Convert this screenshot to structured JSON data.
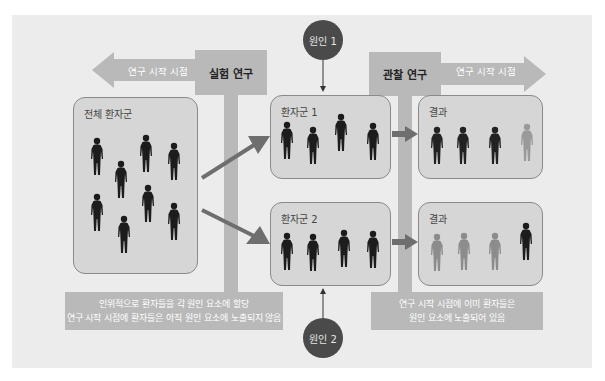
{
  "diagram": {
    "experimental": {
      "label": "실험 연구",
      "arrow_text": "연구 시작 시점",
      "arrow_direction": "left"
    },
    "observational": {
      "label": "관찰 연구",
      "arrow_text": "연구 시작 시점",
      "arrow_direction": "right"
    },
    "causes": [
      {
        "label": "원인 1"
      },
      {
        "label": "원인 2"
      }
    ],
    "whole_population": {
      "title": "전체 환자군",
      "figure_count": 8
    },
    "groups": [
      {
        "title": "환자군 1",
        "figure_count": 4
      },
      {
        "title": "환자군 2",
        "figure_count": 4
      }
    ],
    "results": [
      {
        "title": "결과",
        "figures": [
          "dark",
          "dark",
          "dark",
          "light"
        ]
      },
      {
        "title": "결과",
        "figures": [
          "light",
          "light",
          "light",
          "dark"
        ]
      }
    ],
    "notes": {
      "experimental": [
        "인위적으로 환자들을 각 원인 요소에 할당",
        "연구 시작 시점에 환자들은 아직 원인 요소에 노출되지 않음"
      ],
      "observational": [
        "연구 시작 시점에 이미 환자들은",
        "원인 요소에 노출되어 있음"
      ]
    },
    "colors": {
      "panel_bg": "#ececec",
      "bar": "#b9b9b9",
      "group_bg": "#d6d6d6",
      "arrow": "#6e6e6e",
      "cause_circle": "#4a4a4a",
      "figure_dark": "#1c1c1c",
      "figure_light": "#8c8c8c"
    }
  }
}
